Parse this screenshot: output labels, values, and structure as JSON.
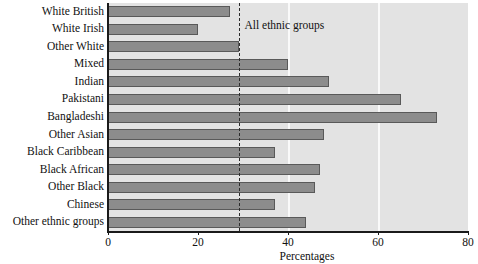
{
  "chart_data": {
    "type": "bar",
    "orientation": "horizontal",
    "title": "",
    "xlabel": "Percentages",
    "ylabel": "",
    "xlim": [
      0,
      80
    ],
    "xticks": [
      0,
      20,
      40,
      60,
      80
    ],
    "xtick_labels": [
      "0",
      "20",
      "40",
      "60",
      "80"
    ],
    "grid": true,
    "gridlines_at": [
      40,
      60
    ],
    "legend": null,
    "categories": [
      "White British",
      "White Irish",
      "Other White",
      "Mixed",
      "Indian",
      "Pakistani",
      "Bangladeshi",
      "Other Asian",
      "Black Caribbean",
      "Black African",
      "Other Black",
      "Chinese",
      "Other ethnic groups"
    ],
    "values": [
      27,
      20,
      29,
      40,
      49,
      65,
      73,
      48,
      37,
      47,
      46,
      37,
      44
    ],
    "annotations": [
      {
        "type": "reference-line",
        "label": "All ethnic groups",
        "value": 29,
        "style": "dashed"
      }
    ],
    "bar_color": "#8c8c8c",
    "bar_edge_color": "#595959",
    "plot_background": "#e3e3e3",
    "axis_color": "#1a1a1a"
  }
}
